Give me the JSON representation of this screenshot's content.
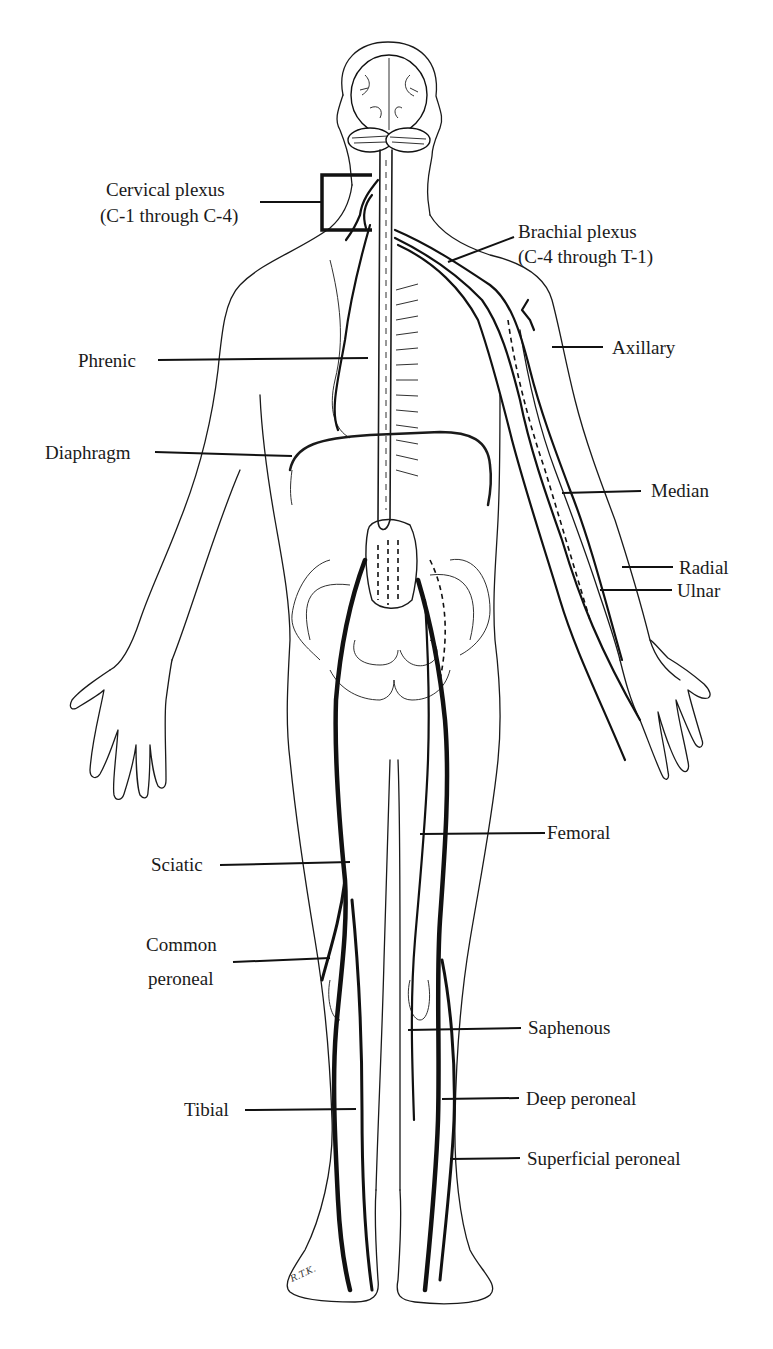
{
  "figure": {
    "type": "anatomical-diagram",
    "signature": "R.T.K."
  },
  "labels": {
    "cervical_plexus": {
      "line1": "Cervical plexus",
      "line2": "(C-1 through C-4)"
    },
    "brachial_plexus": {
      "line1": "Brachial plexus",
      "line2": "(C-4 through T-1)"
    },
    "phrenic": "Phrenic",
    "diaphragm": "Diaphragm",
    "axillary": "Axillary",
    "median": "Median",
    "radial": "Radial",
    "ulnar": "Ulnar",
    "femoral": "Femoral",
    "sciatic": "Sciatic",
    "common_peroneal": {
      "line1": "Common",
      "line2": "peroneal"
    },
    "saphenous": "Saphenous",
    "deep_peroneal": "Deep  peroneal",
    "tibial": "Tibial",
    "superficial_peroneal": "Superficial peroneal"
  }
}
